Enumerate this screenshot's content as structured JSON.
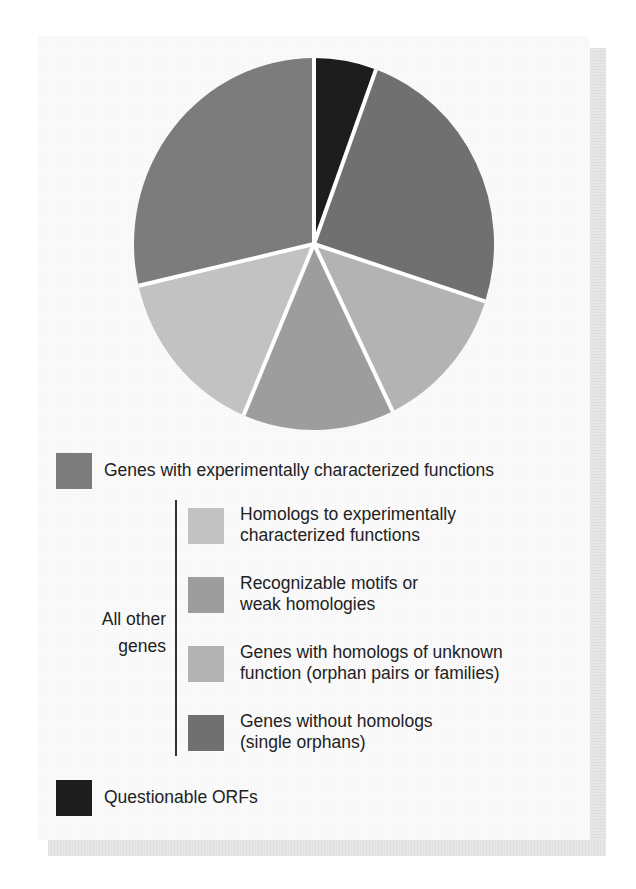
{
  "clipped_caption": "(Source: adapted from ...)",
  "chart_data": {
    "type": "pie",
    "title": "",
    "start_angle_deg": 0,
    "direction": "clockwise",
    "slices": [
      {
        "label": "Questionable ORFs",
        "value": 5.6,
        "color": "#1d1d1d"
      },
      {
        "label": "Genes without homologs (single orphans)",
        "value": 24.4,
        "color": "#707070"
      },
      {
        "label": "Genes with homologs of unknown function (orphan pairs or families)",
        "value": 12.8,
        "color": "#b3b3b3"
      },
      {
        "label": "Recognizable motifs or weak homologies",
        "value": 13.6,
        "color": "#9d9d9d"
      },
      {
        "label": "Homologs to experimentally characterized functions",
        "value": 15.0,
        "color": "#c2c2c2"
      },
      {
        "label": "Genes with experimentally characterized functions",
        "value": 28.6,
        "color": "#7c7c7c"
      }
    ],
    "legend": {
      "position": "bottom",
      "group_label": "All other genes"
    }
  },
  "legend": {
    "top_item": {
      "label": "Genes with experimentally characterized functions",
      "color": "#7c7c7c"
    },
    "group_label_line1": "All other",
    "group_label_line2": "genes",
    "group_items": [
      {
        "line1": "Homologs to experimentally",
        "line2": "characterized functions",
        "color": "#c2c2c2"
      },
      {
        "line1": "Recognizable motifs or",
        "line2": "weak homologies",
        "color": "#9d9d9d"
      },
      {
        "line1": "Genes with homologs of unknown",
        "line2": "function (orphan pairs or families)",
        "color": "#b3b3b3"
      },
      {
        "line1": "Genes without homologs",
        "line2": "(single orphans)",
        "color": "#707070"
      }
    ],
    "bottom_item": {
      "label": "Questionable ORFs",
      "color": "#1d1d1d"
    }
  }
}
